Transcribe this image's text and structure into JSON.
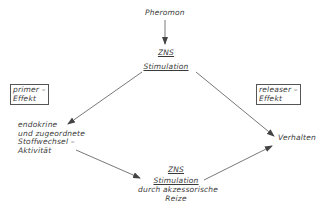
{
  "diagram": {
    "nodes": {
      "pheromon": "Pheromon",
      "zns_top": {
        "line1": "ZNS",
        "line2": "Stimulation"
      },
      "primer": {
        "line1": "primer –",
        "line2": "Effekt"
      },
      "releaser": {
        "line1": "releaser –",
        "line2": "Effekt"
      },
      "endokrine": {
        "line1": "endokrine",
        "line2": "und zugeordnete",
        "line3": "Stoffwechsel –",
        "line4": "Aktivität"
      },
      "verhalten": "Verhalten",
      "zns_bottom": {
        "line1": "ZNS",
        "line2": "Stimulation",
        "line3": "durch akzessorische",
        "line4": "Reize"
      }
    },
    "edges": [
      {
        "from": "Pheromon",
        "to": "ZNS Stimulation"
      },
      {
        "from": "ZNS Stimulation",
        "to": "endokrine und zugeordnete Stoffwechsel-Aktivität"
      },
      {
        "from": "ZNS Stimulation",
        "to": "Verhalten"
      },
      {
        "from": "endokrine und zugeordnete Stoffwechsel-Aktivität",
        "to": "ZNS Stimulation durch akzessorische Reize"
      },
      {
        "from": "ZNS Stimulation durch akzessorische Reize",
        "to": "Verhalten"
      }
    ]
  }
}
